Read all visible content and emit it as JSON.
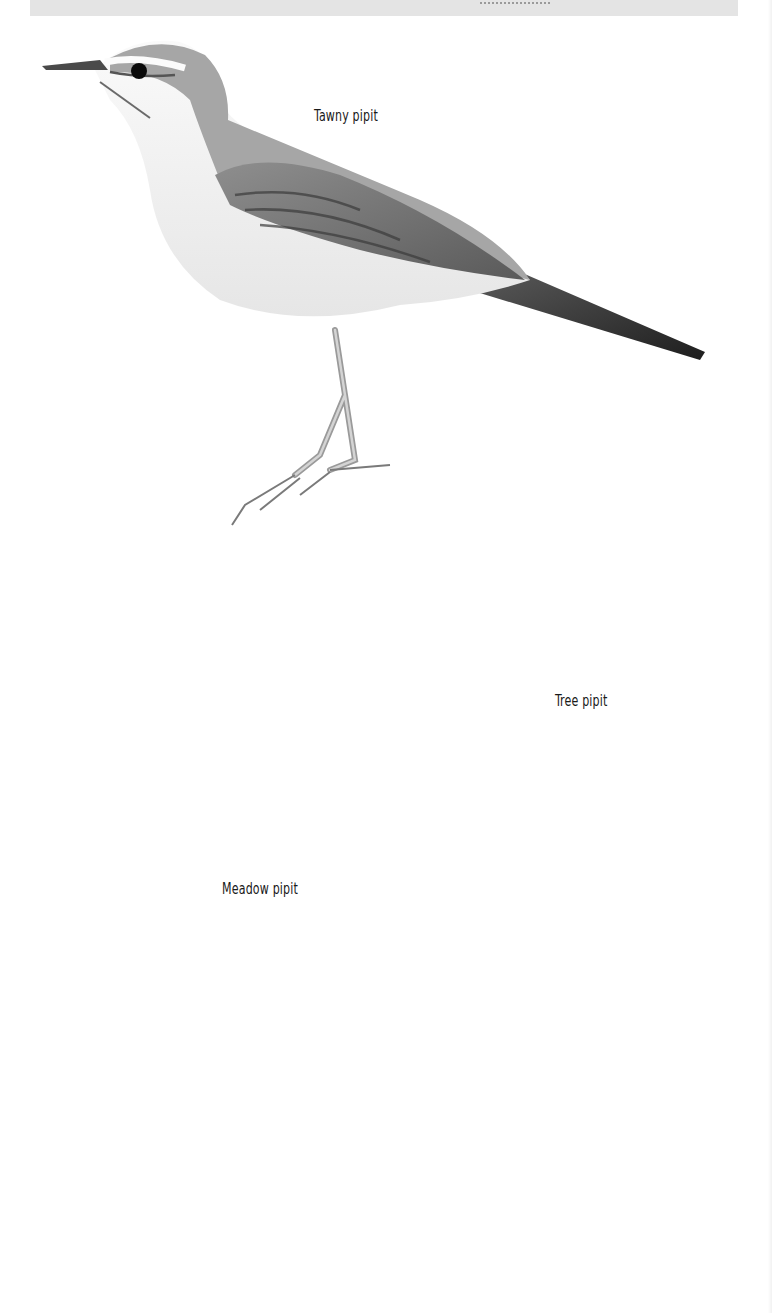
{
  "plate": {
    "description": "Field-guide illustration plate of pipits (grayscale)",
    "header_strip": {
      "text": "",
      "note": "cropped, unreadable"
    },
    "captions": {
      "tawny": "Tawny pipit",
      "tree": "Tree pipit",
      "meadow": "Meadow pipit"
    },
    "figures": [
      {
        "id": "tawny-pipit-standing",
        "species": "Tawny pipit",
        "pose": "standing, facing left"
      },
      {
        "id": "tree-pipit-perched",
        "species": "Tree pipit",
        "pose": "perched on branch, facing right"
      },
      {
        "id": "tree-pipit-small-ground",
        "species": "Tree pipit",
        "pose": "small, walking on ground, facing right"
      },
      {
        "id": "meadow-pipit-standing",
        "species": "Meadow pipit",
        "pose": "standing on ground, facing left"
      },
      {
        "id": "meadow-pipit-flight",
        "species": "Meadow pipit",
        "pose": "in flight, facing left, calling"
      }
    ],
    "colors": {
      "background": "#ffffff",
      "header_strip": "#e4e4e4",
      "dark_plumage": "#2e2e2e",
      "mid_plumage": "#7a7a7a",
      "light_plumage": "#c9c9c9",
      "underparts": "#f2f2f2",
      "caption_text": "#1a1a1a"
    }
  }
}
